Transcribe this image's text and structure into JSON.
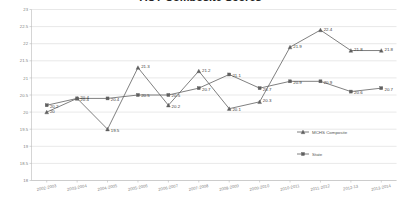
{
  "chart_data": {
    "type": "line",
    "title": "ACT Composite Scores",
    "xlabel": "",
    "ylabel": "",
    "ylim": [
      18,
      23
    ],
    "ytick_step": 0.5,
    "yticks": [
      "23",
      "22.5",
      "22",
      "21.5",
      "21",
      "20.5",
      "20",
      "19.5",
      "19",
      "18.5",
      "18"
    ],
    "grid": true,
    "legend_position": "inside-right",
    "categories": [
      "2002-2003",
      "2003-2004",
      "2004-2005",
      "2005-2006",
      "2006-2007",
      "2007-2008",
      "2008-2009",
      "2009-2010",
      "2010-2011",
      "2011-2012",
      "2012-13",
      "2013-2014"
    ],
    "series": [
      {
        "name": "MCHS Composite",
        "marker": "triangle",
        "color": "#5f5f5f",
        "values": [
          20,
          20.4,
          19.5,
          21.3,
          20.2,
          21.2,
          20.1,
          20.3,
          21.9,
          22.4,
          21.8,
          21.8
        ],
        "labels": [
          "20",
          "20.4",
          "19.5",
          "21.3",
          "20.2",
          "21.2",
          "20.1",
          "20.3",
          "21.9",
          "22.4",
          "21.8",
          "21.8"
        ]
      },
      {
        "name": "State",
        "marker": "square",
        "color": "#5f5f5f",
        "values": [
          20.2,
          20.4,
          20.4,
          20.5,
          20.5,
          20.7,
          21.1,
          20.7,
          20.9,
          20.9,
          20.6,
          20.7
        ],
        "labels": [
          "20.2",
          "20.4",
          "20.4",
          "20.5",
          "20.5",
          "20.7",
          "21.1",
          "20.7",
          "20.9",
          "20.9",
          "20.6",
          "20.7"
        ]
      }
    ]
  },
  "legend": {
    "items": [
      {
        "label": "MCHS Composite",
        "marker": "triangle"
      },
      {
        "label": "State",
        "marker": "square"
      }
    ]
  }
}
